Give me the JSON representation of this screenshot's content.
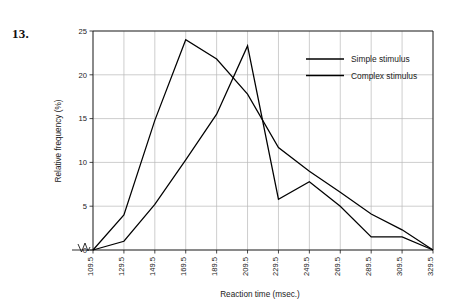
{
  "figure": {
    "problem_number": "13."
  },
  "chart_data": {
    "type": "line",
    "title": "",
    "xlabel": "Reaction time (msec.)",
    "ylabel": "Relative frequency (%)",
    "x": [
      109.5,
      129.5,
      149.5,
      169.5,
      189.5,
      209.5,
      229.5,
      249.5,
      269.5,
      289.5,
      309.5,
      329.5
    ],
    "categories": [
      "109.5",
      "129.5",
      "149.5",
      "169.5",
      "189.5",
      "209.5",
      "229.5",
      "249.5",
      "269.5",
      "289.5",
      "309.5",
      "329.5"
    ],
    "xtick_labels": [
      "109.5",
      "129.5",
      "149.5",
      "169.5",
      "189.5",
      "209.5",
      "229.5",
      "249.5",
      "269.5",
      "289.5",
      "309.5",
      "329.5"
    ],
    "ytick_labels": [
      "0",
      "5",
      "10",
      "15",
      "20",
      "25"
    ],
    "yticks": [
      0,
      5,
      10,
      15,
      20,
      25
    ],
    "ylim": [
      0,
      25
    ],
    "xlim": [
      109.5,
      329.5
    ],
    "grid": true,
    "legend_position": "top-right",
    "axis_break_on_x": true,
    "series": [
      {
        "name": "Simple stimulus",
        "color": "#000000",
        "values": [
          0,
          4.0,
          14.8,
          24.0,
          21.8,
          17.8,
          11.7,
          9.0,
          6.6,
          4.1,
          2.3,
          0
        ]
      },
      {
        "name": "Complex stimulus",
        "color": "#000000",
        "values": [
          0,
          1.0,
          5.2,
          10.3,
          15.5,
          23.3,
          5.8,
          7.8,
          5.0,
          1.5,
          1.5,
          0
        ]
      }
    ]
  },
  "legend": {
    "entries": [
      {
        "label": "Simple stimulus"
      },
      {
        "label": "Complex stimulus"
      }
    ]
  }
}
